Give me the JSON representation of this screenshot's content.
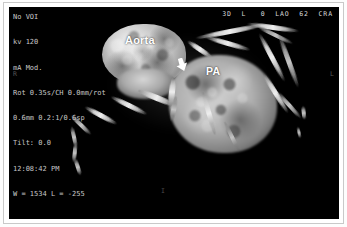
{
  "image": {
    "modality_header": "3D  L   0  LAO  62  CRA",
    "orientation_markers": {
      "left_edge": "R",
      "right_edge": "L",
      "bottom": "I"
    },
    "annotations": [
      {
        "name": "aorta",
        "label": "Aorta"
      },
      {
        "name": "pulmonary-artery",
        "label": "PA"
      }
    ],
    "pointer": {
      "name": "arrow-marker",
      "glyph": "⬇"
    }
  },
  "acquisition_parameters": {
    "lines": [
      "No VOI",
      "kv 120",
      "mA Mod.",
      "Rot 0.35s/CH 0.0mm/rot",
      "0.6mm 0.2:1/0.6sp",
      "Tilt: 0.0",
      "12:08:42 PM",
      "W = 1534 L = -255"
    ],
    "line_0": "No VOI",
    "line_1": "kv 120",
    "line_2": "mA Mod.",
    "line_3": "Rot 0.35s/CH 0.0mm/rot",
    "line_4": "0.6mm 0.2:1/0.6sp",
    "line_5": "Tilt: 0.0",
    "line_6": "12:08:42 PM",
    "line_7": "W = 1534 L = -255"
  },
  "colors": {
    "background": "#000000",
    "page": "#ffffff",
    "frame": "#c9c9c9",
    "overlay_text": "#c8c8c8",
    "annotation_text": "#ffffff"
  }
}
